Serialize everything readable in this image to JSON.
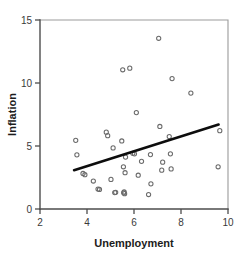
{
  "chart_data": {
    "type": "scatter",
    "title": "",
    "xlabel": "Unemployment",
    "ylabel": "Inflation",
    "xlim": [
      2,
      10
    ],
    "ylim": [
      0,
      15
    ],
    "xticks": [
      2,
      4,
      6,
      8,
      10
    ],
    "yticks": [
      0,
      5,
      10,
      15
    ],
    "xtick_labels": [
      "2",
      "4",
      "6",
      "8",
      "10"
    ],
    "ytick_labels": [
      "0",
      "5",
      "10",
      "15"
    ],
    "grid": false,
    "legend": null,
    "marker": "open-circle",
    "marker_color": "#6b6b6b",
    "points": [
      [
        3.52,
        5.45
      ],
      [
        3.57,
        4.3
      ],
      [
        3.83,
        2.82
      ],
      [
        3.91,
        2.72
      ],
      [
        4.27,
        2.22
      ],
      [
        4.47,
        1.58
      ],
      [
        4.53,
        1.55
      ],
      [
        4.82,
        6.1
      ],
      [
        4.88,
        5.82
      ],
      [
        5.02,
        2.35
      ],
      [
        5.11,
        4.85
      ],
      [
        5.18,
        1.3
      ],
      [
        5.22,
        1.32
      ],
      [
        5.48,
        5.4
      ],
      [
        5.52,
        11.05
      ],
      [
        5.55,
        3.35
      ],
      [
        5.56,
        1.28
      ],
      [
        5.58,
        1.35
      ],
      [
        5.6,
        1.22
      ],
      [
        5.62,
        2.88
      ],
      [
        5.64,
        4.12
      ],
      [
        5.82,
        11.18
      ],
      [
        5.95,
        4.42
      ],
      [
        6.02,
        4.38
      ],
      [
        6.1,
        7.65
      ],
      [
        6.18,
        2.68
      ],
      [
        6.32,
        3.78
      ],
      [
        6.62,
        1.15
      ],
      [
        6.7,
        4.32
      ],
      [
        6.72,
        2.0
      ],
      [
        7.05,
        13.55
      ],
      [
        7.1,
        6.55
      ],
      [
        7.18,
        3.08
      ],
      [
        7.22,
        3.72
      ],
      [
        7.5,
        5.75
      ],
      [
        7.55,
        4.38
      ],
      [
        7.58,
        3.18
      ],
      [
        7.62,
        10.35
      ],
      [
        8.42,
        9.2
      ],
      [
        9.58,
        3.35
      ],
      [
        9.65,
        6.22
      ]
    ],
    "trend_line": {
      "label": "least-squares fit",
      "color": "#0d0d0d",
      "x_start": 3.45,
      "y_start": 3.08,
      "x_end": 9.6,
      "y_end": 6.7
    }
  },
  "figure": {
    "background_color": "#ffffff",
    "axis_color": "#4d4d4d",
    "frame_color": "#9b9b9b"
  }
}
